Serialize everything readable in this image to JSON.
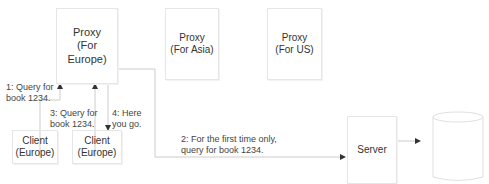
{
  "nodes": {
    "proxy_europe": "Proxy\n(For\nEurope)",
    "proxy_asia": "Proxy\n(For Asia)",
    "proxy_us": "Proxy\n(For US)",
    "client_1": "Client\n(Europe)",
    "client_2": "Client\n(Europe)",
    "server": "Server",
    "database": ""
  },
  "edges": {
    "step1": "1: Query for\nbook 1234.",
    "step2": "2: For the first time only,\nquery for book 1234.",
    "step3": "3: Query for\nbook 1234.",
    "step4": "4: Here\nyou go."
  },
  "colors": {
    "line": "#c8c8c8",
    "border": "#e6e6e6",
    "arrow": "#333333"
  }
}
